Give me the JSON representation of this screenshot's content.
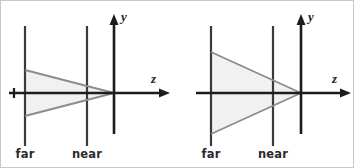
{
  "figure": {
    "background_color": "#ffffff",
    "border_color": "#c8c8c8",
    "width": 354,
    "height": 168
  },
  "style": {
    "plane_line_color": "#3a3a3a",
    "axis_color": "#1c1c1c",
    "frustum_fill_color": "#f0f0f0",
    "frustum_edge_color": "#8c8c8c",
    "label_color": "#2b2b2b"
  },
  "panels": [
    {
      "id": "narrow-fov",
      "axes": {
        "y_label": "y",
        "z_label": "z",
        "origin_x": 113,
        "origin_y": 92,
        "y_axis_top": 16,
        "y_axis_bottom": 133,
        "z_axis_right": 168
      },
      "planes": [
        {
          "name": "far",
          "label": "far",
          "x": 24,
          "line_top": 25,
          "line_bottom": 145,
          "label_x": 24,
          "label_y": 148,
          "half_height": 23
        },
        {
          "name": "near",
          "label": "near",
          "x": 86,
          "line_top": 25,
          "line_bottom": 145,
          "label_x": 86,
          "label_y": 148,
          "half_height": 10
        }
      ],
      "frustum": {
        "apex_x": 113,
        "apex_y": 92,
        "far_top_y": 69,
        "far_bottom_y": 115,
        "far_x": 24
      }
    },
    {
      "id": "wide-fov",
      "axes": {
        "y_label": "y",
        "z_label": "z",
        "origin_x": 123,
        "origin_y": 92,
        "y_axis_top": 16,
        "y_axis_bottom": 133,
        "z_axis_right": 172
      },
      "planes": [
        {
          "name": "far",
          "label": "far",
          "x": 33,
          "line_top": 25,
          "line_bottom": 145,
          "label_x": 33,
          "label_y": 148,
          "half_height": 41
        },
        {
          "name": "near",
          "label": "near",
          "x": 95,
          "line_top": 25,
          "line_bottom": 145,
          "label_x": 95,
          "label_y": 148,
          "half_height": 13
        }
      ],
      "frustum": {
        "apex_x": 123,
        "apex_y": 92,
        "far_top_y": 51,
        "far_bottom_y": 133,
        "far_x": 33
      }
    }
  ]
}
